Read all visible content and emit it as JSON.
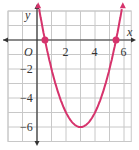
{
  "chart_data": {
    "type": "line",
    "title": "",
    "xlabel": "x",
    "ylabel": "y",
    "origin_label": "O",
    "xlim": [
      -2,
      6.5
    ],
    "ylim": [
      -7,
      2
    ],
    "x_ticks": [
      "2",
      "4",
      "6"
    ],
    "y_ticks": [
      "-2",
      "-4",
      "-6"
    ],
    "grid": true,
    "series": [
      {
        "name": "parabola",
        "equation": "y = x^2 - 6x + 3",
        "vertex": [
          3,
          -6
        ],
        "x_intercepts": [
          0.55,
          5.45
        ],
        "color": "#d6336c"
      }
    ],
    "points": [
      [
        0.55,
        0
      ],
      [
        5.45,
        0
      ]
    ]
  },
  "colors": {
    "curve": "#d6336c",
    "grid": "#c8c8c8",
    "axis": "#333333"
  }
}
